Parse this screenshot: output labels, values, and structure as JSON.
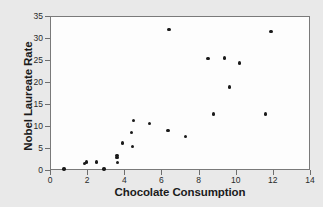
{
  "chart_data": {
    "type": "scatter",
    "title": "",
    "xlabel": "Chocolate Consumption",
    "ylabel": "Nobel Laureate Rate",
    "xlim": [
      0,
      14
    ],
    "ylim": [
      0,
      35
    ],
    "xticks": [
      0,
      2,
      4,
      6,
      8,
      10,
      12,
      14
    ],
    "yticks": [
      0,
      5,
      10,
      15,
      20,
      25,
      30,
      35
    ],
    "grid": false,
    "legend": null,
    "marker_color": "#1a1a1a",
    "plot_background": "#fdfdfd",
    "page_background": "#e9e9e9",
    "points": [
      {
        "x": 0.75,
        "y": 0.2
      },
      {
        "x": 1.85,
        "y": 1.5
      },
      {
        "x": 1.95,
        "y": 1.8
      },
      {
        "x": 2.5,
        "y": 1.8
      },
      {
        "x": 2.9,
        "y": 0.2
      },
      {
        "x": 3.6,
        "y": 3.3
      },
      {
        "x": 3.6,
        "y": 2.9
      },
      {
        "x": 3.65,
        "y": 1.7
      },
      {
        "x": 3.9,
        "y": 6.1
      },
      {
        "x": 4.4,
        "y": 8.5
      },
      {
        "x": 4.45,
        "y": 5.4
      },
      {
        "x": 4.5,
        "y": 11.3
      },
      {
        "x": 5.35,
        "y": 10.6
      },
      {
        "x": 6.4,
        "y": 31.9
      },
      {
        "x": 6.35,
        "y": 9.0
      },
      {
        "x": 7.3,
        "y": 7.6
      },
      {
        "x": 8.5,
        "y": 25.3
      },
      {
        "x": 8.8,
        "y": 12.7
      },
      {
        "x": 9.4,
        "y": 25.5
      },
      {
        "x": 9.65,
        "y": 18.9
      },
      {
        "x": 10.2,
        "y": 24.3
      },
      {
        "x": 11.6,
        "y": 12.7
      },
      {
        "x": 11.9,
        "y": 31.5
      }
    ]
  }
}
